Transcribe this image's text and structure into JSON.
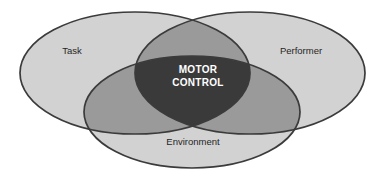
{
  "diagram": {
    "type": "venn-3-set",
    "background_color": "#ffffff",
    "outline_color": "#3b3b3b",
    "sets": [
      {
        "id": "task",
        "label": "Task",
        "position": "left",
        "fill_color": "#d2d2d2",
        "label_x": 72,
        "label_y": 51
      },
      {
        "id": "performer",
        "label": "Performer",
        "position": "right",
        "fill_color": "#d2d2d2",
        "label_x": 301,
        "label_y": 51
      },
      {
        "id": "environment",
        "label": "Environment",
        "position": "bottom",
        "fill_color": "#d2d2d2",
        "label_x": 193,
        "label_y": 142
      }
    ],
    "pairwise_overlap": {
      "fill_color": "#9a9a9a"
    },
    "center_intersection": {
      "id": "motor-control",
      "line1": "MOTOR",
      "line2": "CONTROL",
      "fill_color": "#3a3a3a",
      "text_color": "#ffffff",
      "label_x": 198,
      "label_y_line1": 70,
      "label_y_line2": 83
    }
  }
}
